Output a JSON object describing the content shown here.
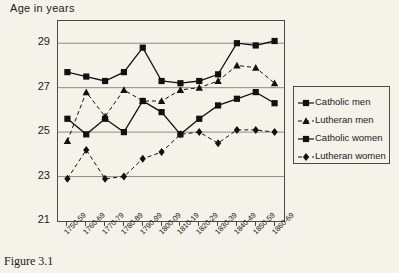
{
  "caption": "Figure 3.1",
  "legend": {
    "position": "right",
    "items": [
      {
        "label": "Catholic men",
        "marker": "square",
        "line": "solid"
      },
      {
        "label": "Lutheran men",
        "marker": "triangle",
        "line": "dashed"
      },
      {
        "label": "Catholic women",
        "marker": "square",
        "line": "solid"
      },
      {
        "label": "Lutheran women",
        "marker": "diamond",
        "line": "dashed"
      }
    ]
  },
  "chart_data": {
    "type": "line",
    "title": "",
    "ylabel": "Age in years",
    "xlabel": "",
    "ylim": [
      21,
      30
    ],
    "yticks": [
      21,
      23,
      25,
      27,
      29
    ],
    "grid": true,
    "categories": [
      "1750-59",
      "1760-69",
      "1770-79",
      "1780-89",
      "1790-99",
      "1800-09",
      "1810-19",
      "1820-29",
      "1830-39",
      "1840-49",
      "1850-59",
      "1860-69"
    ],
    "series": [
      {
        "name": "Catholic men",
        "marker": "square",
        "line": "solid",
        "values": [
          27.7,
          27.5,
          27.3,
          27.7,
          28.8,
          27.3,
          27.2,
          27.3,
          27.6,
          29.0,
          28.9,
          29.1
        ]
      },
      {
        "name": "Lutheran men",
        "marker": "triangle",
        "line": "dashed",
        "values": [
          24.6,
          26.8,
          25.7,
          26.9,
          26.4,
          26.4,
          26.9,
          27.0,
          27.3,
          28.0,
          27.9,
          27.2
        ]
      },
      {
        "name": "Catholic women",
        "marker": "square",
        "line": "solid",
        "values": [
          25.6,
          24.9,
          25.6,
          25.0,
          26.4,
          25.9,
          24.9,
          25.6,
          26.2,
          26.5,
          26.8,
          26.3
        ]
      },
      {
        "name": "Lutheran women",
        "marker": "diamond",
        "line": "dashed",
        "values": [
          22.9,
          24.2,
          22.9,
          23.0,
          23.8,
          24.1,
          24.9,
          25.0,
          24.5,
          25.1,
          25.1,
          25.0
        ]
      }
    ]
  }
}
